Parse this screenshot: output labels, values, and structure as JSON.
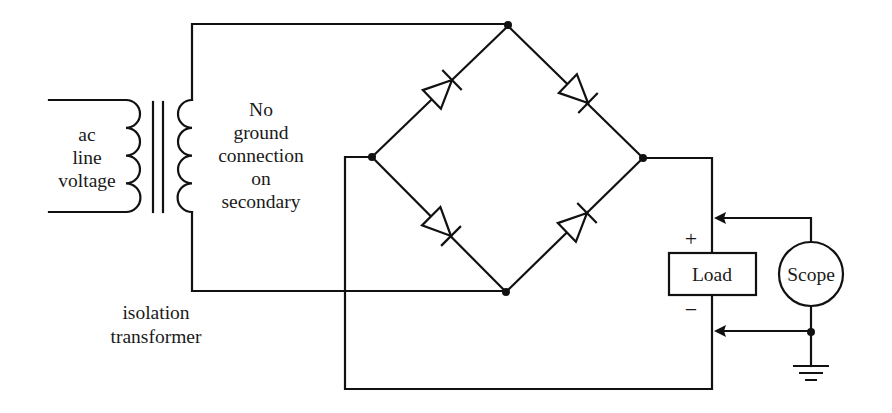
{
  "diagram": {
    "type": "full-wave bridge rectifier with isolation transformer",
    "labels": {
      "primary": [
        "ac",
        "line",
        "voltage"
      ],
      "secondary_note": [
        "No",
        "ground",
        "connection",
        "on",
        "secondary"
      ],
      "transformer": [
        "isolation",
        "transformer"
      ],
      "load": "Load",
      "scope": "Scope",
      "plus": "+",
      "minus": "−"
    },
    "components": [
      {
        "id": "isolation-transformer",
        "kind": "transformer",
        "primary_turns": 4,
        "secondary_turns": 4
      },
      {
        "id": "diode-upper-left",
        "kind": "diode",
        "orientation": "toward top node"
      },
      {
        "id": "diode-upper-right",
        "kind": "diode",
        "orientation": "toward right node"
      },
      {
        "id": "diode-lower-left",
        "kind": "diode",
        "orientation": "toward bottom node"
      },
      {
        "id": "diode-lower-right",
        "kind": "diode",
        "orientation": "toward right node"
      },
      {
        "id": "load",
        "kind": "resistor-box"
      },
      {
        "id": "scope",
        "kind": "meter-circle"
      },
      {
        "id": "ground",
        "kind": "ground"
      }
    ],
    "colors": {
      "line": "#111111",
      "background": "#ffffff"
    }
  }
}
